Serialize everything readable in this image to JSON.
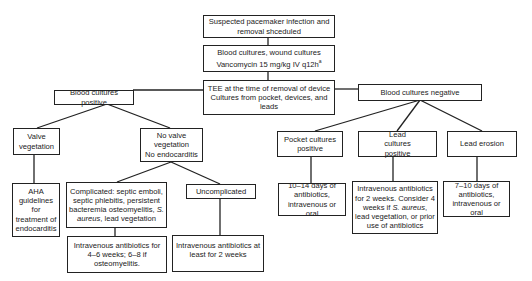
{
  "nodes": {
    "start": "Suspected pacemaker infection and removal shceduled",
    "cultures_line1": "Blood cultures, wound cultures",
    "cultures_line2": "Vancomycin 15 mg/kg IV q12h",
    "cultures_footnote": "a",
    "tee": "TEE at the time of removal of device Cultures from pocket, devices, and leads",
    "blood_positive": "Blood cultures positive",
    "blood_negative": "Blood cultures negative",
    "valve_vegetation": "Valve vegetation",
    "no_valve_vegetation_1": "No valve vegetation",
    "no_valve_vegetation_2": "No endocarditis",
    "aha": "AHA guidelines for treatment of endocarditis",
    "complicated_pre": "Complicated: septic emboli, septic phlebitis, persistent bacteremia osteomyelitis, ",
    "complicated_italic": "S. aureus",
    "complicated_post": ", lead vegetation",
    "uncomplicated": "Uncomplicated",
    "iv_4_6": "Intravenous antibiotics for 4–6 weeks; 6–8 if osteomyelitis.",
    "iv_atleast_2": "Intravenous antibiotics at least for 2 weeks",
    "pocket_positive": "Pocket cultures positive",
    "lead_positive": "Lead cultures positive",
    "lead_erosion": "Lead erosion",
    "pocket_tx": "10–14 days of antibiotics, intravenous or oral",
    "lead_tx_pre": "Intravenous antibiotics for 2 weeks. Consider 4 weeks if ",
    "lead_tx_italic": "S. aureus",
    "lead_tx_post": ", lead vegetation, or prior use of antibiotics",
    "erosion_tx": "7–10 days of antibiotics, intravenous or oral"
  }
}
